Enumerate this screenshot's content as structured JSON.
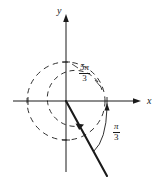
{
  "figure": {
    "axes": {
      "x_label": "x",
      "y_label": "y"
    },
    "labels": {
      "coterminal_angle": {
        "numerator": "5π",
        "denominator": "3",
        "text": "5π/3"
      },
      "reference_angle": {
        "numerator": "π",
        "denominator": "3",
        "text": "π/3"
      }
    },
    "colors": {
      "stroke": "#1a1a1a",
      "background": "#ffffff"
    },
    "geometry": {
      "origin": {
        "x": 66,
        "y": 101
      },
      "circle_radius": 39,
      "terminal_ray_end": {
        "x": 107,
        "y": 176
      },
      "x_axis": {
        "x1": 13,
        "x2": 141,
        "y": 101
      },
      "y_axis": {
        "x": 66,
        "y1": 14,
        "y2": 172
      },
      "x_ticks": [
        28,
        107
      ],
      "y_ticks": [
        62,
        140
      ]
    }
  }
}
